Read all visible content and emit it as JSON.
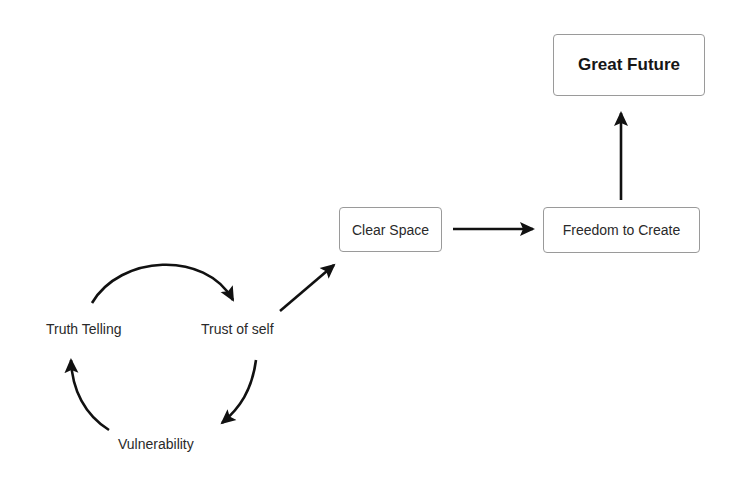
{
  "diagram": {
    "nodes": {
      "great_future": {
        "label": "Great Future"
      },
      "clear_space": {
        "label": "Clear Space"
      },
      "freedom_to_create": {
        "label": "Freedom to Create"
      },
      "truth_telling": {
        "label": "Truth Telling"
      },
      "trust_of_self": {
        "label": "Trust of self"
      },
      "vulnerability": {
        "label": "Vulnerability"
      }
    },
    "edges": [
      {
        "from": "Truth Telling",
        "to": "Trust of self",
        "style": "curved"
      },
      {
        "from": "Trust of self",
        "to": "Vulnerability",
        "style": "curved"
      },
      {
        "from": "Vulnerability",
        "to": "Truth Telling",
        "style": "curved"
      },
      {
        "from": "Trust of self",
        "to": "Clear Space",
        "style": "straight"
      },
      {
        "from": "Clear Space",
        "to": "Freedom to Create",
        "style": "straight"
      },
      {
        "from": "Freedom to Create",
        "to": "Great Future",
        "style": "straight"
      }
    ],
    "colors": {
      "arrow": "#111111",
      "box_border": "#9a9a9a",
      "text": "#2a2a2a"
    }
  }
}
